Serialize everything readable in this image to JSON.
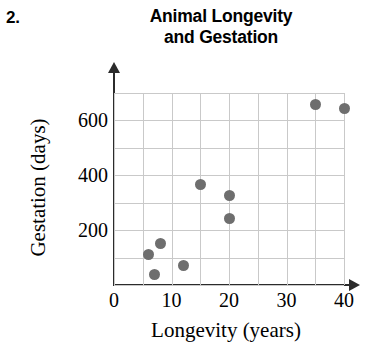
{
  "problem": {
    "number": "2."
  },
  "chart_data": {
    "type": "scatter",
    "title": "Animal Longevity and Gestation",
    "title_lines": [
      "Animal Longevity",
      "and Gestation"
    ],
    "xlabel": "Longevity (years)",
    "ylabel": "Gestation (days)",
    "xlim": [
      0,
      40
    ],
    "ylim": [
      0,
      700
    ],
    "xticks": [
      0,
      10,
      20,
      30,
      40
    ],
    "xtick_labels": [
      "0",
      "10",
      "20",
      "30",
      "40"
    ],
    "yticks": [
      200,
      400,
      600
    ],
    "ytick_labels": [
      "200",
      "400",
      "600"
    ],
    "grid": true,
    "grid_x_step": 5,
    "grid_y_step": 100,
    "legend": "none",
    "marker_color": "#6e6e6e",
    "grid_color": "#c9c9c9",
    "axis_color": "#2b2b2b",
    "points": [
      {
        "x": 6,
        "y": 113
      },
      {
        "x": 7,
        "y": 40
      },
      {
        "x": 8,
        "y": 150
      },
      {
        "x": 12,
        "y": 70
      },
      {
        "x": 15,
        "y": 365
      },
      {
        "x": 20,
        "y": 325
      },
      {
        "x": 20,
        "y": 242
      },
      {
        "x": 35,
        "y": 659
      },
      {
        "x": 40,
        "y": 645
      }
    ]
  }
}
